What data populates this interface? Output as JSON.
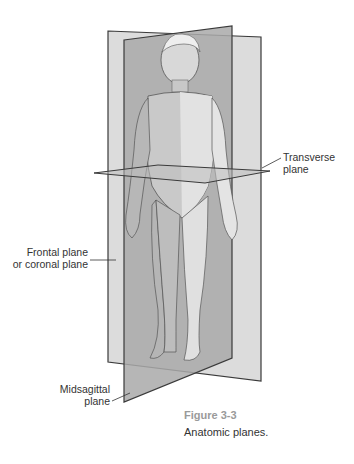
{
  "figure": {
    "number": "Figure 3-3",
    "caption": "Anatomic planes.",
    "labels": {
      "transverse_line1": "Transverse",
      "transverse_line2": "plane",
      "frontal_line1": "Frontal plane",
      "frontal_line2": "or coronal plane",
      "midsagittal_line1": "Midsagittal",
      "midsagittal_line2": "plane"
    },
    "colors": {
      "frontal_plane": "#dcdcdc",
      "midsagittal_plane": "#a9a9a9",
      "transverse_plane": "#bdbdbd",
      "outline": "#3a3a3a",
      "caption_number": "#9a9a9a",
      "text": "#333333"
    }
  }
}
